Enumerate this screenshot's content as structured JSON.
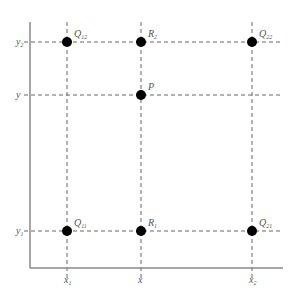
{
  "diagram": {
    "type": "bilinear-interpolation-grid",
    "axes": {
      "origin": [
        30,
        268
      ],
      "x_end": 283,
      "y_end": 22,
      "color": "#888888"
    },
    "grid": {
      "x_lines": [
        {
          "id": "x1",
          "px": 67
        },
        {
          "id": "x",
          "px": 141
        },
        {
          "id": "x2",
          "px": 252
        }
      ],
      "y_lines": [
        {
          "id": "y2",
          "px": 42
        },
        {
          "id": "y",
          "px": 95
        },
        {
          "id": "y1",
          "px": 231
        }
      ],
      "dash_color": "#666666"
    },
    "x_labels": [
      {
        "main": "x",
        "sub": "1",
        "px": 67
      },
      {
        "main": "x",
        "sub": "",
        "px": 141
      },
      {
        "main": "x",
        "sub": "2",
        "px": 252
      }
    ],
    "y_labels": [
      {
        "main": "y",
        "sub": "2",
        "py": 42
      },
      {
        "main": "y",
        "sub": "",
        "py": 95
      },
      {
        "main": "y",
        "sub": "1",
        "py": 231
      }
    ],
    "points": [
      {
        "name": "Q",
        "sub": "12",
        "cx": 67,
        "cy": 42
      },
      {
        "name": "R",
        "sub": "2",
        "cx": 141,
        "cy": 42
      },
      {
        "name": "Q",
        "sub": "22",
        "cx": 252,
        "cy": 42
      },
      {
        "name": "P",
        "sub": "",
        "cx": 141,
        "cy": 95
      },
      {
        "name": "Q",
        "sub": "11",
        "cx": 67,
        "cy": 231
      },
      {
        "name": "R",
        "sub": "1",
        "cx": 141,
        "cy": 231
      },
      {
        "name": "Q",
        "sub": "21",
        "cx": 252,
        "cy": 231
      }
    ],
    "point_color": "#000000"
  }
}
